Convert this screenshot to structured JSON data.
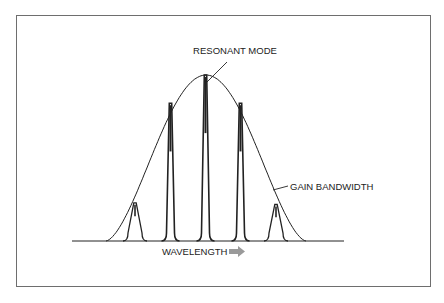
{
  "diagram": {
    "labels": {
      "resonant_mode": "RESONANT MODE",
      "gain_bandwidth": "GAIN BANDWIDTH",
      "wavelength": "WAVELENGTH"
    },
    "colors": {
      "line": "#222222",
      "frame": "#6e6e6e",
      "arrow": "#9a9a9a",
      "background": "#ffffff"
    },
    "gain_envelope": {
      "shape": "bell",
      "relative_peak": 1.0
    },
    "modes": [
      {
        "index": 1,
        "relative_height": 0.23
      },
      {
        "index": 2,
        "relative_height": 0.83
      },
      {
        "index": 3,
        "relative_height": 1.0
      },
      {
        "index": 4,
        "relative_height": 0.83
      },
      {
        "index": 5,
        "relative_height": 0.22
      }
    ]
  }
}
